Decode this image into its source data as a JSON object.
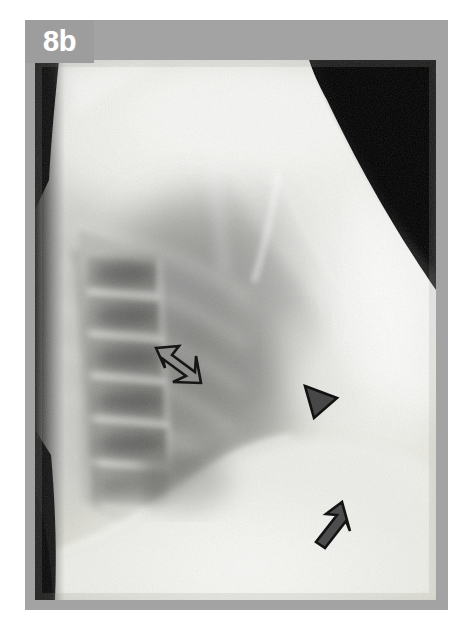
{
  "figure": {
    "panel_label": "8b",
    "modality": "radiograph",
    "view": "lateral chest",
    "caption_visible": false,
    "frame_color": "#a3a3a3",
    "badge_color": "#9d9d9d",
    "badge_text_color": "#ffffff",
    "background_color": "#ffffff"
  },
  "image": {
    "name": "lateral-chest-radiograph",
    "alt": "Lateral chest radiograph showing thoracic vertebral bodies, retrocardiac lung, diaphragm and anterior chest wall",
    "collimation_corner": "upper-right black triangle",
    "left_edge_shadow": "dark posterior soft-tissue wedge",
    "tone_light": "#f2f2f0",
    "tone_mid": "#b9b9b6",
    "tone_dark": "#6e6e6c",
    "tone_black": "#0c0c0c"
  },
  "annotations": [
    {
      "id": "open-arrow",
      "name": "open-arrow-marker",
      "style": "hollow outlined arrow",
      "direction": "down-right",
      "stroke_color": "#1a1a1a",
      "fill_color": "#8e8e8c",
      "x": 120,
      "y": 285,
      "label": ""
    },
    {
      "id": "arrowhead",
      "name": "solid-arrowhead-marker",
      "style": "solid filled triangle",
      "direction": "down-left",
      "stroke_color": "#1a1a1a",
      "fill_color": "#4a4a4a",
      "x": 270,
      "y": 325,
      "label": ""
    },
    {
      "id": "solid-arrow",
      "name": "solid-arrow-marker",
      "style": "solid filled arrow",
      "direction": "up-right",
      "stroke_color": "#1a1a1a",
      "fill_color": "#4f4f4f",
      "x": 280,
      "y": 435,
      "label": ""
    }
  ]
}
